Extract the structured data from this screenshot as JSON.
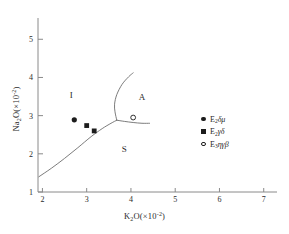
{
  "chart_data": {
    "type": "scatter",
    "title": "",
    "xlabel": "K2O(×10⁻²)",
    "ylabel": "Na2O(×10⁻²)",
    "xlabel_parts": {
      "base": "K",
      "sub": "2",
      "rest": "O(×10",
      "sup": "-2",
      "tail": ")"
    },
    "ylabel_parts": {
      "base": "Na",
      "sub": "2",
      "rest": "O(×10",
      "sup": "-2",
      "tail": ")"
    },
    "xlim": [
      1.9,
      7.3
    ],
    "ylim": [
      1.0,
      5.4
    ],
    "xticks": [
      "2",
      "3",
      "4",
      "5",
      "6",
      "7"
    ],
    "xtick_values": [
      2,
      3,
      4,
      5,
      6,
      7
    ],
    "yticks": [
      "1",
      "2",
      "3",
      "4",
      "5"
    ],
    "ytick_values": [
      1,
      2,
      3,
      4,
      5
    ],
    "grid": false,
    "legend_position": "right",
    "field_labels": [
      {
        "text": "I",
        "x": 2.65,
        "y": 3.45
      },
      {
        "text": "A",
        "x": 4.25,
        "y": 3.4
      },
      {
        "text": "S",
        "x": 3.85,
        "y": 2.05
      }
    ],
    "boundaries": [
      {
        "name": "S-I lower boundary",
        "points": [
          [
            1.92,
            1.4
          ],
          [
            2.2,
            1.62
          ],
          [
            2.5,
            1.88
          ],
          [
            2.8,
            2.16
          ],
          [
            3.1,
            2.45
          ],
          [
            3.35,
            2.66
          ],
          [
            3.55,
            2.8
          ],
          [
            3.68,
            2.88
          ]
        ]
      },
      {
        "name": "I-A upper boundary",
        "points": [
          [
            3.68,
            2.88
          ],
          [
            3.64,
            3.1
          ],
          [
            3.63,
            3.3
          ],
          [
            3.68,
            3.55
          ],
          [
            3.8,
            3.82
          ],
          [
            3.95,
            4.02
          ],
          [
            4.05,
            4.12
          ]
        ]
      },
      {
        "name": "A-S right boundary",
        "points": [
          [
            3.68,
            2.88
          ],
          [
            3.85,
            2.85
          ],
          [
            4.05,
            2.82
          ],
          [
            4.25,
            2.8
          ],
          [
            4.42,
            2.8
          ]
        ]
      }
    ],
    "series": [
      {
        "name": "E2δμ",
        "marker": "circle-filled",
        "points": [
          [
            2.72,
            2.89
          ]
        ]
      },
      {
        "name": "E2γδ",
        "marker": "square-filled",
        "points": [
          [
            3.0,
            2.74
          ],
          [
            3.17,
            2.6
          ]
        ]
      },
      {
        "name": "E3ηγβ",
        "marker": "circle-open",
        "points": [
          [
            4.05,
            2.95
          ]
        ]
      }
    ]
  },
  "legend": {
    "items": [
      {
        "symbol": "circle-filled",
        "prefix": "E",
        "sub": "2",
        "greek": "δμ"
      },
      {
        "symbol": "square-filled",
        "prefix": "E",
        "sub": "2",
        "greek": "γδ"
      },
      {
        "symbol": "circle-open",
        "prefix": "E",
        "sub": "3",
        "greek": "ηγβ"
      }
    ]
  }
}
